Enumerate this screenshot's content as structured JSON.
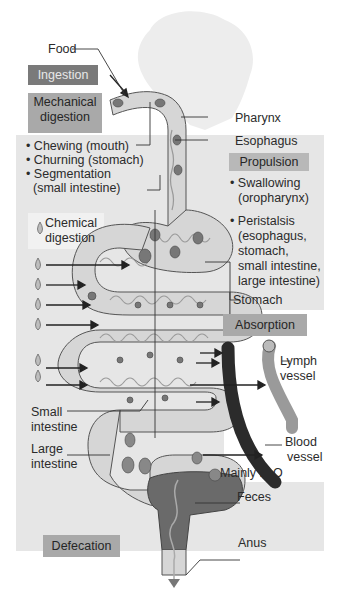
{
  "diagram": {
    "title": "",
    "process_labels": {
      "ingestion": "Ingestion",
      "mechanical_digestion": "Mechanical digestion",
      "mechanical_line1": "Mechanical",
      "mechanical_line2": "digestion",
      "propulsion": "Propulsion",
      "chemical_digestion_line1": "Chemical",
      "chemical_digestion_line2": "digestion",
      "absorption": "Absorption",
      "defecation": "Defecation"
    },
    "mechanical_items": [
      "• Chewing (mouth)",
      "• Churning (stomach)",
      "• Segmentation",
      "(small intestine)"
    ],
    "propulsion_items": [
      "• Swallowing",
      "(oropharynx)",
      "• Peristalsis",
      "(esophagus,",
      "stomach,",
      "small intestine,",
      "large intestine)"
    ],
    "anatomy_labels": {
      "food": "Food",
      "pharynx": "Pharynx",
      "esophagus": "Esophagus",
      "stomach": "Stomach",
      "lymph_line1": "Lymph",
      "lymph_line2": "vessel",
      "blood_line1": "Blood",
      "blood_line2": "vessel",
      "small_int_line1": "Small",
      "small_int_line2": "intestine",
      "large_int_line1": "Large",
      "large_int_line2": "intestine",
      "mainly": "Mainly H",
      "h2o_sub": "2",
      "h2o_o": "O",
      "feces": "Feces",
      "anus": "Anus"
    },
    "colors": {
      "panel": "#e6e6e6",
      "ingestion_box": "#7a7a7a",
      "process_box": "#a9a9a9",
      "tract_fill": "#d4d4d4",
      "blood_vessel": "#2b2b2b",
      "lymph_vessel": "#9a9a9a",
      "feces": "#6a6a6a"
    }
  }
}
